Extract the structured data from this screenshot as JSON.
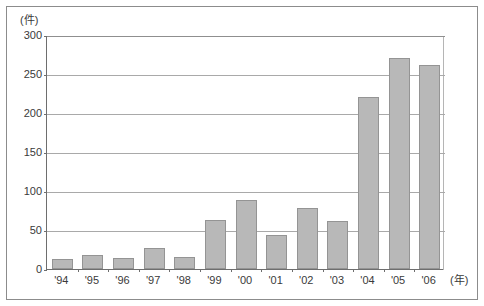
{
  "chart_data": {
    "type": "bar",
    "title": "",
    "subtitle": "",
    "xlabel": "(年)",
    "ylabel": "(件)",
    "categories": [
      "'94",
      "'95",
      "'96",
      "'97",
      "'98",
      "'99",
      "'00",
      "'01",
      "'02",
      "'03",
      "'04",
      "'05",
      "'06"
    ],
    "values": [
      13,
      18,
      14,
      27,
      16,
      63,
      89,
      43,
      78,
      61,
      221,
      270,
      261
    ],
    "ylim": [
      0,
      300
    ],
    "yticks": [
      0,
      50,
      100,
      150,
      200,
      250,
      300
    ],
    "ytick_labels": [
      "0",
      "50",
      "100",
      "150",
      "200",
      "250",
      "300"
    ],
    "grid": true,
    "grid_axis": "y",
    "legend": false,
    "legend_position": "none",
    "bar_color": "#b8b8b8",
    "bar_edge_color": "#949494",
    "axis_color": "#6e6e6e",
    "grid_color": "#a9a9a9",
    "text_color": "#3a3a3a",
    "frame_color": "#8c8c8c",
    "background": "#ffffff"
  },
  "axis": {
    "y_unit_label": "(件)",
    "x_unit_label": "(年)"
  }
}
